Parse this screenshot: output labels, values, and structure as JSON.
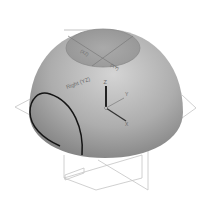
{
  "scene": {
    "object": "hemisphere",
    "colors": {
      "background": "#ffffff",
      "surface_light": "#d2d2d2",
      "surface_mid": "#a9a9a9",
      "surface_dark": "#7c7c7c",
      "plane_lines": "#b8b8b8",
      "edge": "#111111"
    }
  },
  "labels": {
    "right_plane": "Right (YZ)",
    "top_plane_a": "(XZ)",
    "top_plane_b": "(XY)"
  },
  "triad": {
    "z": "Z",
    "y": "Y",
    "x": "X"
  }
}
